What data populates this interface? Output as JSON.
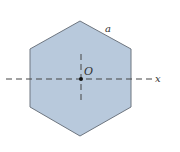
{
  "diagram": {
    "shape": "regular hexagon",
    "labels": {
      "side": "a",
      "center": "O",
      "axis": "x"
    },
    "colors": {
      "fill": "#b8c9dc",
      "stroke": "#6e7680",
      "dash": "#444444",
      "point": "#111111"
    }
  }
}
